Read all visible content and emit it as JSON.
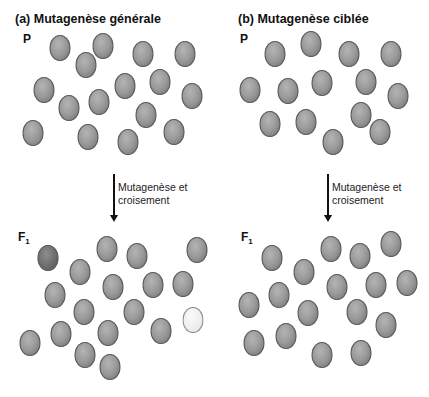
{
  "panels": [
    {
      "title": "(a) Mutagenèse générale",
      "parent_label": "P",
      "f1_label": "F",
      "f1_sub": "1",
      "step_line1": "Mutagenèse et",
      "step_line2": "croisement",
      "parent_cells": [
        [
          60,
          48
        ],
        [
          103,
          46
        ],
        [
          143,
          54
        ],
        [
          185,
          54
        ],
        [
          86,
          65
        ],
        [
          44,
          90
        ],
        [
          125,
          86
        ],
        [
          160,
          82
        ],
        [
          192,
          96
        ],
        [
          69,
          108
        ],
        [
          99,
          102
        ],
        [
          146,
          115
        ],
        [
          33,
          133
        ],
        [
          88,
          137
        ],
        [
          128,
          142
        ],
        [
          174,
          132
        ]
      ],
      "f1_cells": [
        {
          "x": 48,
          "y": 258,
          "type": "dark"
        },
        {
          "x": 107,
          "y": 249,
          "type": "normal"
        },
        {
          "x": 137,
          "y": 256,
          "type": "normal"
        },
        {
          "x": 197,
          "y": 250,
          "type": "normal"
        },
        {
          "x": 80,
          "y": 272,
          "type": "normal"
        },
        {
          "x": 113,
          "y": 287,
          "type": "normal"
        },
        {
          "x": 153,
          "y": 285,
          "type": "normal"
        },
        {
          "x": 183,
          "y": 284,
          "type": "normal"
        },
        {
          "x": 55,
          "y": 295,
          "type": "normal"
        },
        {
          "x": 84,
          "y": 312,
          "type": "normal"
        },
        {
          "x": 134,
          "y": 312,
          "type": "normal"
        },
        {
          "x": 161,
          "y": 331,
          "type": "normal"
        },
        {
          "x": 193,
          "y": 320,
          "type": "mutant"
        },
        {
          "x": 30,
          "y": 343,
          "type": "normal"
        },
        {
          "x": 61,
          "y": 334,
          "type": "normal"
        },
        {
          "x": 108,
          "y": 333,
          "type": "normal"
        },
        {
          "x": 85,
          "y": 355,
          "type": "normal"
        },
        {
          "x": 110,
          "y": 367,
          "type": "normal"
        }
      ]
    },
    {
      "title": "(b) Mutagenèse ciblée",
      "parent_label": "P",
      "f1_label": "F",
      "f1_sub": "1",
      "step_line1": "Mutagenèse et",
      "step_line2": "croisement",
      "parent_cells": [
        [
          275,
          54
        ],
        [
          311,
          44
        ],
        [
          349,
          54
        ],
        [
          391,
          54
        ],
        [
          250,
          90
        ],
        [
          288,
          91
        ],
        [
          322,
          83
        ],
        [
          366,
          82
        ],
        [
          398,
          96
        ],
        [
          270,
          124
        ],
        [
          306,
          122
        ],
        [
          361,
          115
        ],
        [
          333,
          142
        ],
        [
          380,
          132
        ]
      ],
      "f1_cells": [
        {
          "x": 272,
          "y": 258,
          "type": "normal"
        },
        {
          "x": 331,
          "y": 249,
          "type": "normal"
        },
        {
          "x": 360,
          "y": 256,
          "type": "normal"
        },
        {
          "x": 391,
          "y": 244,
          "type": "normal"
        },
        {
          "x": 304,
          "y": 272,
          "type": "normal"
        },
        {
          "x": 337,
          "y": 287,
          "type": "normal"
        },
        {
          "x": 376,
          "y": 285,
          "type": "normal"
        },
        {
          "x": 407,
          "y": 283,
          "type": "normal"
        },
        {
          "x": 249,
          "y": 305,
          "type": "normal"
        },
        {
          "x": 279,
          "y": 295,
          "type": "normal"
        },
        {
          "x": 308,
          "y": 313,
          "type": "normal"
        },
        {
          "x": 357,
          "y": 312,
          "type": "normal"
        },
        {
          "x": 386,
          "y": 325,
          "type": "normal"
        },
        {
          "x": 254,
          "y": 343,
          "type": "normal"
        },
        {
          "x": 286,
          "y": 336,
          "type": "normal"
        },
        {
          "x": 322,
          "y": 355,
          "type": "normal"
        },
        {
          "x": 361,
          "y": 353,
          "type": "normal"
        }
      ]
    }
  ]
}
